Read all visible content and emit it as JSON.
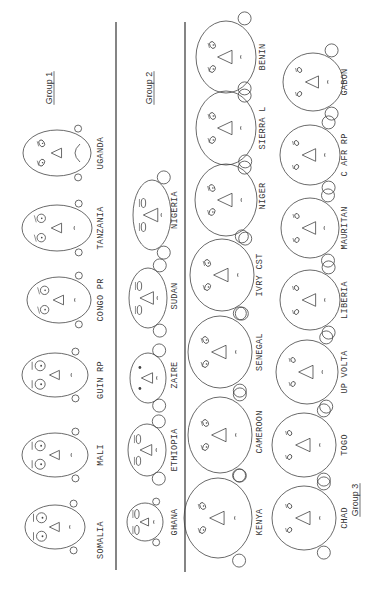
{
  "figure": {
    "type": "chernoff-faces",
    "orientation": "rotated 90deg counter-clockwise",
    "ink_color": "#444444",
    "background": "#ffffff"
  },
  "groups": [
    {
      "label": "Group 1",
      "label_pos": [
        52,
        88
      ],
      "faces": [
        {
          "name": "SOMALIA",
          "cx": 55,
          "cy": 527,
          "rx": 30,
          "ry": 22,
          "eye": "big",
          "ears": "small",
          "label_x": 103,
          "label_y": 540
        },
        {
          "name": "MALI",
          "cx": 55,
          "cy": 455,
          "rx": 33,
          "ry": 22,
          "eye": "big",
          "ears": "small",
          "label_x": 103,
          "label_y": 455
        },
        {
          "name": "GUIN RP",
          "cx": 55,
          "cy": 375,
          "rx": 33,
          "ry": 22,
          "eye": "big",
          "ears": "small",
          "label_x": 103,
          "label_y": 380
        },
        {
          "name": "CONGO PR",
          "cx": 59,
          "cy": 300,
          "rx": 32,
          "ry": 23,
          "eye": "medium",
          "ears": "small",
          "label_x": 103,
          "label_y": 300
        },
        {
          "name": "TANZANIA",
          "cx": 57,
          "cy": 228,
          "rx": 35,
          "ry": 23,
          "eye": "medium",
          "ears": "small",
          "label_x": 103,
          "label_y": 228
        },
        {
          "name": "UGANDA",
          "cx": 57,
          "cy": 153,
          "rx": 34,
          "ry": 23,
          "eye": "slant",
          "ears": "small",
          "label_x": 103,
          "label_y": 153
        }
      ]
    },
    {
      "label": "Group 2",
      "label_pos": [
        152,
        88
      ],
      "faces": [
        {
          "name": "GHANA",
          "cx": 145,
          "cy": 522,
          "rx": 18,
          "ry": 19,
          "eye": "flat",
          "ears": "small",
          "label_x": 177,
          "label_y": 522
        },
        {
          "name": "ETHIOPIA",
          "cx": 147,
          "cy": 450,
          "rx": 19,
          "ry": 26,
          "eye": "flat",
          "ears": "big",
          "label_x": 177,
          "label_y": 450
        },
        {
          "name": "ZAIRE",
          "cx": 148,
          "cy": 378,
          "rx": 18,
          "ry": 25,
          "eye": "dot",
          "ears": "big",
          "label_x": 177,
          "label_y": 375
        },
        {
          "name": "SUDAN",
          "cx": 148,
          "cy": 298,
          "rx": 19,
          "ry": 30,
          "eye": "flat",
          "ears": "big",
          "label_x": 177,
          "label_y": 296
        },
        {
          "name": "NIGERIA",
          "cx": 152,
          "cy": 215,
          "rx": 19,
          "ry": 35,
          "eye": "flat",
          "ears": "big",
          "label_x": 177,
          "label_y": 210
        }
      ]
    },
    {
      "label": "Group 3",
      "label_pos": [
        358,
        500
      ],
      "faces": [
        {
          "name": "KENYA",
          "cx": 218,
          "cy": 518,
          "rx": 34,
          "ry": 40,
          "eye": "slant",
          "ears": "big",
          "label_x": 262,
          "label_y": 522
        },
        {
          "name": "CAMEROON",
          "cx": 220,
          "cy": 435,
          "rx": 32,
          "ry": 38,
          "eye": "slant",
          "ears": "big",
          "label_x": 262,
          "label_y": 432
        },
        {
          "name": "SENEGAL",
          "cx": 220,
          "cy": 352,
          "rx": 32,
          "ry": 36,
          "eye": "slant",
          "ears": "big",
          "label_x": 262,
          "label_y": 352
        },
        {
          "name": "IVRY CST",
          "cx": 222,
          "cy": 275,
          "rx": 32,
          "ry": 36,
          "eye": "slant",
          "ears": "big",
          "label_x": 262,
          "label_y": 275
        },
        {
          "name": "NIGER",
          "cx": 226,
          "cy": 200,
          "rx": 31,
          "ry": 36,
          "eye": "slant",
          "ears": "big",
          "label_x": 265,
          "label_y": 196
        },
        {
          "name": "SIERRA L",
          "cx": 226,
          "cy": 128,
          "rx": 30,
          "ry": 37,
          "eye": "slant",
          "ears": "big",
          "label_x": 265,
          "label_y": 128
        },
        {
          "name": "BENIN",
          "cx": 226,
          "cy": 57,
          "rx": 30,
          "ry": 36,
          "eye": "slant",
          "ears": "big",
          "label_x": 265,
          "label_y": 57
        },
        {
          "name": "CHAD",
          "cx": 304,
          "cy": 518,
          "rx": 32,
          "ry": 32,
          "eye": "small",
          "ears": "big",
          "label_x": 347,
          "label_y": 518
        },
        {
          "name": "TOGO",
          "cx": 304,
          "cy": 445,
          "rx": 32,
          "ry": 32,
          "eye": "small",
          "ears": "big",
          "label_x": 347,
          "label_y": 445
        },
        {
          "name": "UP VOLTA",
          "cx": 307,
          "cy": 372,
          "rx": 31,
          "ry": 32,
          "eye": "small",
          "ears": "big",
          "label_x": 347,
          "label_y": 372
        },
        {
          "name": "LIBERIA",
          "cx": 310,
          "cy": 300,
          "rx": 30,
          "ry": 30,
          "eye": "small",
          "ears": "big",
          "label_x": 347,
          "label_y": 300
        },
        {
          "name": "MAURITAN",
          "cx": 310,
          "cy": 228,
          "rx": 29,
          "ry": 30,
          "eye": "small",
          "ears": "big",
          "label_x": 347,
          "label_y": 228
        },
        {
          "name": "C AFR RP",
          "cx": 310,
          "cy": 155,
          "rx": 30,
          "ry": 30,
          "eye": "small",
          "ears": "big",
          "label_x": 347,
          "label_y": 155
        },
        {
          "name": "GABON",
          "cx": 313,
          "cy": 82,
          "rx": 30,
          "ry": 29,
          "eye": "small",
          "ears": "big",
          "label_x": 347,
          "label_y": 82
        }
      ]
    }
  ],
  "separators": [
    {
      "x": 116,
      "y1": 22,
      "y2": 570
    },
    {
      "x": 185,
      "y1": 22,
      "y2": 572
    }
  ]
}
